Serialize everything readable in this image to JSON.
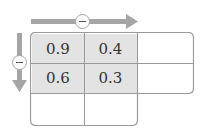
{
  "diagram": {
    "type": "subtraction-table",
    "top_arrow": {
      "operator": "minus",
      "direction": "right"
    },
    "left_arrow": {
      "operator": "minus",
      "direction": "down"
    },
    "rows": [
      [
        "0.9",
        "0.4",
        ""
      ],
      [
        "0.6",
        "0.3",
        ""
      ],
      [
        "",
        ""
      ]
    ],
    "colors": {
      "shaded": "#e3e3e3",
      "border": "#9a9a9a",
      "arrow": "#a5a5a5"
    }
  }
}
